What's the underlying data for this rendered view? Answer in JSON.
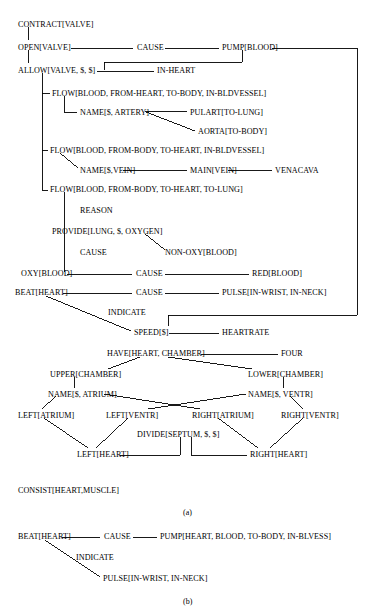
{
  "figure": {
    "type": "semantic-network-diagram",
    "caption_a": "(a)",
    "caption_b": "(b)",
    "line_color": "#000000",
    "text_color": "#000000",
    "background": "#ffffff"
  },
  "panel_a": {
    "nodes": [
      {
        "id": "contract_valve",
        "label": "CONTRACT[VALVE]",
        "x": 18,
        "y": 20
      },
      {
        "id": "open_valve",
        "label": "OPEN[VALVE]",
        "x": 18,
        "y": 43
      },
      {
        "id": "cause_1",
        "label": "CAUSE",
        "x": 137,
        "y": 43
      },
      {
        "id": "pump_blood",
        "label": "PUMP[BLOOD]",
        "x": 222,
        "y": 43
      },
      {
        "id": "allow_valve",
        "label": "ALLOW[VALVE, $, $]",
        "x": 18,
        "y": 66
      },
      {
        "id": "in_heart",
        "label": "IN-HEART",
        "x": 157,
        "y": 66
      },
      {
        "id": "flow_1",
        "label": "FLOW[BLOOD, FROM-HEART, TO-BODY, IN-BLDVESSEL]",
        "x": 52,
        "y": 89
      },
      {
        "id": "name_artery",
        "label": "NAME[$, ARTERY]",
        "x": 80,
        "y": 108
      },
      {
        "id": "pulart",
        "label": "PULART[TO-LUNG]",
        "x": 190,
        "y": 108
      },
      {
        "id": "aorta",
        "label": "AORTA[TO-BODY]",
        "x": 198,
        "y": 127
      },
      {
        "id": "flow_2",
        "label": "FLOW[BLOOD, FROM-BODY, TO-HEART, IN-BLDVESSEL]",
        "x": 50,
        "y": 146
      },
      {
        "id": "name_vein",
        "label": "NAME[$,VEIN]",
        "x": 80,
        "y": 166
      },
      {
        "id": "main_vein",
        "label": "MAIN[VEIN]",
        "x": 190,
        "y": 166
      },
      {
        "id": "venacava",
        "label": "VENACAVA",
        "x": 275,
        "y": 166
      },
      {
        "id": "flow_3",
        "label": "FLOW[BLOOD, FROM-BODY, TO-HEART, TO-LUNG]",
        "x": 50,
        "y": 185
      },
      {
        "id": "reason",
        "label": "REASON",
        "x": 80,
        "y": 206
      },
      {
        "id": "provide_lung",
        "label": "PROVIDE[LUNG, $, OXYGEN]",
        "x": 52,
        "y": 227
      },
      {
        "id": "cause_2",
        "label": "CAUSE",
        "x": 80,
        "y": 248
      },
      {
        "id": "non_oxy_blood",
        "label": "NON-OXY[BLOOD]",
        "x": 165,
        "y": 248
      },
      {
        "id": "oxy_blood",
        "label": "OXY[BLOOD]",
        "x": 21,
        "y": 269
      },
      {
        "id": "cause_3",
        "label": "CAUSE",
        "x": 136,
        "y": 269
      },
      {
        "id": "red_blood",
        "label": "RED[BLOOD]",
        "x": 252,
        "y": 269
      },
      {
        "id": "beat_heart",
        "label": "BEAT[HEART]",
        "x": 15,
        "y": 288
      },
      {
        "id": "cause_4",
        "label": "CAUSE",
        "x": 136,
        "y": 288
      },
      {
        "id": "pulse",
        "label": "PULSE[IN-WRIST, IN-NECK]",
        "x": 222,
        "y": 288
      },
      {
        "id": "indicate_a",
        "label": "INDICATE",
        "x": 108,
        "y": 308
      },
      {
        "id": "speed",
        "label": "SPEED[$]",
        "x": 134,
        "y": 328
      },
      {
        "id": "heartrate",
        "label": "HEARTRATE",
        "x": 222,
        "y": 328
      },
      {
        "id": "have_chamber",
        "label": "HAVE[HEART, CHAMBER]",
        "x": 107,
        "y": 349
      },
      {
        "id": "four",
        "label": "FOUR",
        "x": 281,
        "y": 349
      },
      {
        "id": "upper_chamber",
        "label": "UPPER[CHAMBER]",
        "x": 50,
        "y": 370
      },
      {
        "id": "lower_chamber",
        "label": "LOWER[CHAMBER]",
        "x": 248,
        "y": 370
      },
      {
        "id": "name_atrium",
        "label": "NAME[$, ATRIUM]",
        "x": 48,
        "y": 390
      },
      {
        "id": "name_ventr",
        "label": "NAME[$, VENTR]",
        "x": 248,
        "y": 390
      },
      {
        "id": "left_atrium",
        "label": "LEFT[ATRIUM]",
        "x": 18,
        "y": 411
      },
      {
        "id": "left_ventr",
        "label": "LEFT[VENTR]",
        "x": 106,
        "y": 411
      },
      {
        "id": "right_atrium",
        "label": "RIGHT[ATRIUM]",
        "x": 192,
        "y": 411
      },
      {
        "id": "right_ventr",
        "label": "RIGHT[VENTR]",
        "x": 281,
        "y": 411
      },
      {
        "id": "divide_septum",
        "label": "DIVIDE[SEPTUM, $, $]",
        "x": 137,
        "y": 430
      },
      {
        "id": "left_heart",
        "label": "LEFT[HEART]",
        "x": 77,
        "y": 450
      },
      {
        "id": "right_heart",
        "label": "RIGHT[HEART]",
        "x": 250,
        "y": 450
      },
      {
        "id": "consist_heart",
        "label": "CONSIST[HEART,MUSCLE]",
        "x": 18,
        "y": 486
      }
    ]
  },
  "panel_b": {
    "nodes": [
      {
        "id": "b_beat_heart",
        "label": "BEAT[HEART]",
        "x": 18,
        "y": 532
      },
      {
        "id": "b_cause",
        "label": "CAUSE",
        "x": 104,
        "y": 532
      },
      {
        "id": "b_pump",
        "label": "PUMP[HEART, BLOOD, TO-BODY, IN-BLVESS]",
        "x": 160,
        "y": 532
      },
      {
        "id": "b_indicate",
        "label": "INDICATE",
        "x": 76,
        "y": 553
      },
      {
        "id": "b_pulse",
        "label": "PULSE[IN-WRIST, IN-NECK]",
        "x": 103,
        "y": 574
      }
    ]
  }
}
